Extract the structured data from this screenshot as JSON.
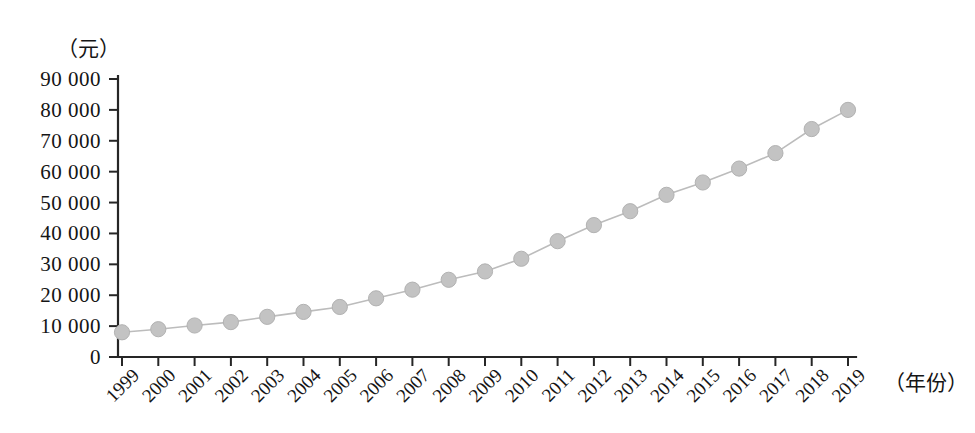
{
  "chart_data": {
    "type": "line",
    "title": "",
    "xlabel": "（年份）",
    "ylabel": "（元）",
    "categories": [
      "1999",
      "2000",
      "2001",
      "2002",
      "2003",
      "2004",
      "2005",
      "2006",
      "2007",
      "2008",
      "2009",
      "2010",
      "2011",
      "2012",
      "2013",
      "2014",
      "2015",
      "2016",
      "2017",
      "2018",
      "2019"
    ],
    "values": [
      8000,
      9000,
      10200,
      11300,
      13000,
      14600,
      16200,
      19000,
      21800,
      25000,
      27700,
      31800,
      37500,
      42700,
      47200,
      52500,
      56500,
      61000,
      66000,
      73800,
      80000
    ],
    "series": [
      {
        "name": "人均可支配收入",
        "values": [
          8000,
          9000,
          10200,
          11300,
          13000,
          14600,
          16200,
          19000,
          21800,
          25000,
          27700,
          31800,
          37500,
          42700,
          47200,
          52500,
          56500,
          61000,
          66000,
          73800,
          80000
        ]
      }
    ],
    "ytick_labels": [
      "0",
      "10 000",
      "20 000",
      "30 000",
      "40 000",
      "50 000",
      "60 000",
      "70 000",
      "80 000",
      "90 000"
    ],
    "ytick_values": [
      0,
      10000,
      20000,
      30000,
      40000,
      50000,
      60000,
      70000,
      80000,
      90000
    ],
    "ylim": [
      0,
      90000
    ],
    "xlim": [
      "1999",
      "2019"
    ],
    "grid": false,
    "legend": false,
    "legend_position": "none",
    "marker": "circle",
    "marker_color": "#c3c3c3",
    "line_color": "#bcbcbc",
    "axis_color": "#262626",
    "background_color": "#ffffff",
    "xtick_rotation": 45
  }
}
